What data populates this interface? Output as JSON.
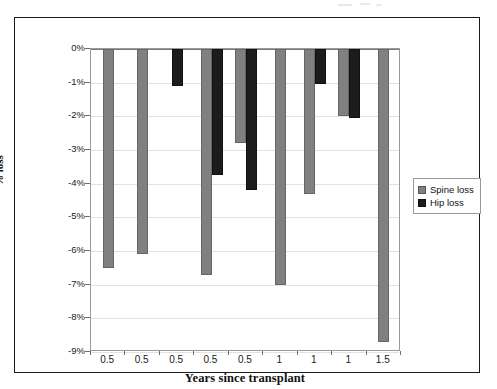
{
  "chart_data": {
    "type": "bar",
    "title": "",
    "xlabel": "Years since transplant",
    "ylabel": "% loss",
    "ylim": [
      -9,
      0
    ],
    "ytick_labels": [
      "0%",
      "-1%",
      "-2%",
      "-3%",
      "-4%",
      "-5%",
      "-6%",
      "-7%",
      "-8%",
      "-9%"
    ],
    "ytick_values": [
      0,
      -1,
      -2,
      -3,
      -4,
      -5,
      -6,
      -7,
      -8,
      -9
    ],
    "categories": [
      "0.5",
      "0.5",
      "0.5",
      "0.5",
      "0.5",
      "1",
      "1",
      "1",
      "1.5"
    ],
    "grid": true,
    "legend_position": "right",
    "series": [
      {
        "name": "Spine loss",
        "color": "#808080",
        "values": [
          -6.5,
          -6.1,
          null,
          -6.7,
          -2.8,
          -7.0,
          -4.3,
          -2.0,
          -8.7
        ]
      },
      {
        "name": "Hip loss",
        "color": "#1c1c1c",
        "values": [
          null,
          null,
          -1.1,
          -3.75,
          -4.2,
          null,
          -1.05,
          -2.05,
          null
        ]
      }
    ]
  },
  "legend": {
    "items": [
      {
        "label": "Spine loss",
        "swatch": "spine"
      },
      {
        "label": "Hip loss",
        "swatch": "hip"
      }
    ]
  },
  "axes": {
    "y_title": "% loss",
    "x_title": "Years since transplant"
  }
}
